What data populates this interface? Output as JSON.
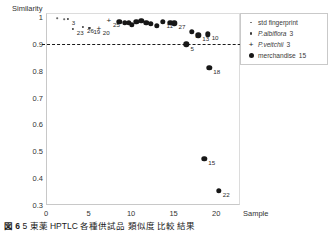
{
  "chart_data": {
    "type": "scatter",
    "title": "",
    "xlabel": "Sample",
    "ylabel": "Similarity",
    "xlim": [
      0,
      22.8
    ],
    "ylim": [
      0.3,
      1.015
    ],
    "xticks": [
      "0",
      "5",
      "10",
      "15",
      "20"
    ],
    "xtick_values": [
      0,
      5,
      10,
      15,
      20
    ],
    "yticks": [
      "0.3",
      "0.4",
      "0.5",
      "0.6",
      "0.7",
      "0.8",
      "0.9",
      "1"
    ],
    "ytick_values": [
      0.3,
      0.4,
      0.5,
      0.6,
      0.7,
      0.8,
      0.9,
      1.0
    ],
    "grid": false,
    "legend_position": "top-right",
    "threshold": {
      "value": 0.9,
      "style": "dashed",
      "label": ""
    },
    "series": [
      {
        "name": "std fingerprint",
        "marker": "small-dot",
        "count_label": "",
        "points": [
          {
            "x": 1.35,
            "y": 0.995,
            "label": ""
          },
          {
            "x": 2.15,
            "y": 0.993,
            "label": ""
          }
        ]
      },
      {
        "name": "P.albiflora",
        "marker": "dot",
        "count_label": "3",
        "points": [
          {
            "x": 2.55,
            "y": 0.992,
            "label": "3"
          },
          {
            "x": 3.15,
            "y": 0.957,
            "label": "23"
          },
          {
            "x": 4.35,
            "y": 0.962,
            "label": "26"
          },
          {
            "x": 5.1,
            "y": 0.961,
            "label": "19"
          }
        ]
      },
      {
        "name": "P.veitchii",
        "marker": "plus",
        "count_label": "3",
        "points": [
          {
            "x": 7.4,
            "y": 0.985,
            "label": "25"
          },
          {
            "x": 6.2,
            "y": 0.957,
            "label": "20"
          }
        ]
      },
      {
        "name": "merchandise",
        "marker": "filled-circle",
        "count_label": "15",
        "points": [
          {
            "x": 8.6,
            "y": 0.982,
            "label": ""
          },
          {
            "x": 9.25,
            "y": 0.978,
            "label": ""
          },
          {
            "x": 9.7,
            "y": 0.979,
            "label": ""
          },
          {
            "x": 10.1,
            "y": 0.972,
            "label": ""
          },
          {
            "x": 10.6,
            "y": 0.982,
            "label": ""
          },
          {
            "x": 11.2,
            "y": 0.985,
            "label": ""
          },
          {
            "x": 11.8,
            "y": 0.978,
            "label": ""
          },
          {
            "x": 12.3,
            "y": 0.975,
            "label": ""
          },
          {
            "x": 13.0,
            "y": 0.968,
            "label": ""
          },
          {
            "x": 13.7,
            "y": 0.983,
            "label": "11"
          },
          {
            "x": 14.6,
            "y": 0.979,
            "label": ""
          },
          {
            "x": 15.1,
            "y": 0.977,
            "label": "27"
          },
          {
            "x": 16.5,
            "y": 0.898,
            "label": "5"
          },
          {
            "x": 17.1,
            "y": 0.944,
            "label": "2"
          },
          {
            "x": 17.9,
            "y": 0.932,
            "label": "13"
          },
          {
            "x": 19.0,
            "y": 0.936,
            "label": "10"
          },
          {
            "x": 19.2,
            "y": 0.812,
            "label": "18"
          },
          {
            "x": 18.6,
            "y": 0.472,
            "label": "15"
          },
          {
            "x": 20.3,
            "y": 0.352,
            "label": "22"
          }
        ]
      }
    ]
  },
  "legend": {
    "items": [
      {
        "label": "std fingerprint",
        "count": "",
        "marker": "small-dot-icon",
        "italic": false
      },
      {
        "label": "P.albiflora",
        "count": "3",
        "marker": "dot-icon",
        "italic": true
      },
      {
        "label": "P.veitchii",
        "count": "3",
        "marker": "plus-icon",
        "italic": true
      },
      {
        "label": "merchandise",
        "count": "15",
        "marker": "filled-circle-icon",
        "italic": false
      }
    ]
  },
  "caption": {
    "figure_number": "図 6",
    "text": "5  東薬 HPTLC 各種供試品 類似度 比較 結果"
  }
}
